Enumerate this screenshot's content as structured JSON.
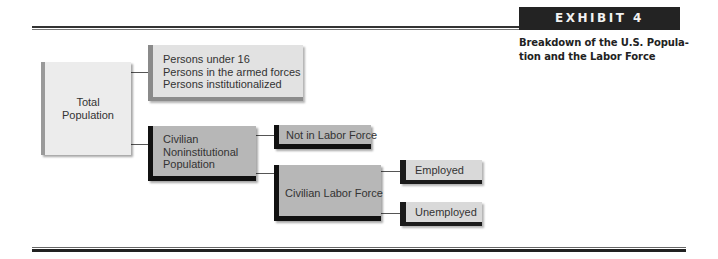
{
  "exhibit": {
    "tag": "EXHIBIT 4",
    "caption_line1": "Breakdown of the U.S. Popula-",
    "caption_line2": "tion and the Labor Force"
  },
  "diagram": {
    "nodes": {
      "total_population": {
        "line1": "Total",
        "line2": "Population"
      },
      "excluded": {
        "line1": "Persons under 16",
        "line2": "Persons in the armed forces",
        "line3": "Persons institutionalized"
      },
      "civilian_noninstitutional": {
        "line1": "Civilian",
        "line2": "Noninstitutional",
        "line3": "Population"
      },
      "not_in_labor_force": {
        "label": "Not in Labor Force"
      },
      "civilian_labor_force": {
        "label": "Civilian Labor Force"
      },
      "employed": {
        "label": "Employed"
      },
      "unemployed": {
        "label": "Unemployed"
      }
    },
    "edges": [
      [
        "Total Population",
        "Persons under 16 / armed forces / institutionalized"
      ],
      [
        "Total Population",
        "Civilian Noninstitutional Population"
      ],
      [
        "Civilian Noninstitutional Population",
        "Not in Labor Force"
      ],
      [
        "Civilian Noninstitutional Population",
        "Civilian Labor Force"
      ],
      [
        "Civilian Labor Force",
        "Employed"
      ],
      [
        "Civilian Labor Force",
        "Unemployed"
      ]
    ],
    "colors": {
      "tag_bg": "#232323",
      "dark_bar": "#111111",
      "light_box": "#ececec",
      "mid_box": "#b7b7b7"
    }
  }
}
